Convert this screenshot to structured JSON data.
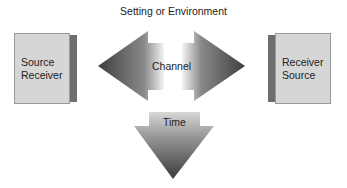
{
  "title": "Setting or Environment",
  "left_box": {
    "line1": "Source",
    "line2": "Receiver"
  },
  "right_box": {
    "line1": "Receiver",
    "line2": "Source"
  },
  "channel": {
    "label": "Channel"
  },
  "time": {
    "label": "Time"
  },
  "colors": {
    "box_face": "#d6d6d6",
    "box_side": "#6e6e6e",
    "arrow_dark": "#4a4a4a",
    "arrow_light": "#f2f2f2"
  }
}
